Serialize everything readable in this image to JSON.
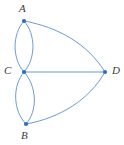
{
  "figure": {
    "kind": "graph-diagram",
    "background_color": "#ffffff",
    "edge_color": "#5b8fc9",
    "vertex_color": "#2e6fba",
    "label_color": "#3c3c3c"
  },
  "vertices": [
    {
      "id": "A",
      "label": "A",
      "x": 24,
      "y": 21
    },
    {
      "id": "C",
      "label": "C",
      "x": 24,
      "y": 72
    },
    {
      "id": "B",
      "label": "B",
      "x": 26,
      "y": 124
    },
    {
      "id": "D",
      "label": "D",
      "x": 105,
      "y": 72
    }
  ],
  "edges": [
    {
      "id": "edge-A-C-left",
      "from": "A",
      "to": "C",
      "style": "curved",
      "bulge": "left"
    },
    {
      "id": "edge-A-C-right",
      "from": "A",
      "to": "C",
      "style": "curved",
      "bulge": "right"
    },
    {
      "id": "edge-C-B-left",
      "from": "C",
      "to": "B",
      "style": "curved",
      "bulge": "left"
    },
    {
      "id": "edge-C-B-right",
      "from": "C",
      "to": "B",
      "style": "curved",
      "bulge": "right"
    },
    {
      "id": "edge-C-D",
      "from": "C",
      "to": "D",
      "style": "straight",
      "bulge": "none"
    },
    {
      "id": "edge-A-D",
      "from": "A",
      "to": "D",
      "style": "curved",
      "bulge": "inward"
    },
    {
      "id": "edge-B-D",
      "from": "B",
      "to": "D",
      "style": "curved",
      "bulge": "inward"
    }
  ],
  "geometry": {
    "edge_A_C_left_path": "M 24 21 C 12 34 12 59 24 72",
    "edge_A_C_right_path": "M 24 21 C 36 34 36 59 24 72",
    "edge_C_B_left_path": "M 24 72 C 12 86 13 111 26 124",
    "edge_C_B_right_path": "M 24 72 C 37 86 38 111 26 124",
    "edge_C_D_path": "M 24 72 L 105 72",
    "edge_A_D_path": "M 24 21 C 58 27 88 44 105 72",
    "edge_B_D_path": "M 26 124 C 60 118 89 100 105 72",
    "vertex_radius": 2.1
  }
}
